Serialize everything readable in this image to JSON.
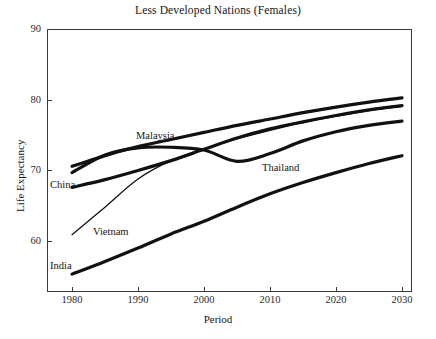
{
  "chart_data": {
    "type": "line",
    "title": "Less Developed Nations (Females)",
    "xlabel": "Period",
    "ylabel": "Life Expectancy",
    "xlim": [
      1977,
      2033
    ],
    "ylim": [
      55,
      90
    ],
    "xticks": [
      1980,
      1990,
      2000,
      2010,
      2020,
      2030
    ],
    "yticks": [
      60,
      70,
      80,
      90
    ],
    "grid": false,
    "legend": "inline-labels",
    "x": [
      1980,
      1985,
      1990,
      1995,
      2000,
      2005,
      2010,
      2015,
      2020,
      2025,
      2030
    ],
    "series": [
      {
        "name": "Malaysia",
        "label": "Malaysia",
        "values": [
          70.6,
          72.1,
          73.4,
          74.4,
          75.4,
          76.4,
          77.3,
          78.2,
          79.0,
          79.7,
          80.3
        ],
        "stroke": "thick"
      },
      {
        "name": "Thailand",
        "label": "Thailand",
        "values": [
          69.7,
          72.2,
          73.2,
          73.3,
          72.9,
          71.3,
          72.4,
          74.2,
          75.5,
          76.4,
          77.0
        ],
        "stroke": "thick"
      },
      {
        "name": "China",
        "label": "China",
        "values": [
          67.6,
          68.7,
          70.0,
          71.4,
          73.0,
          74.6,
          75.9,
          76.9,
          77.8,
          78.6,
          79.2
        ],
        "stroke": "thick"
      },
      {
        "name": "Vietnam",
        "label": "Vietnam",
        "values": [
          60.9,
          64.8,
          68.8,
          71.4,
          73.1,
          74.5,
          75.7,
          76.8,
          77.7,
          78.5,
          79.1
        ],
        "stroke": "thin"
      },
      {
        "name": "India",
        "label": "India",
        "values": [
          55.3,
          57.1,
          59.0,
          61.0,
          62.8,
          64.8,
          66.7,
          68.3,
          69.7,
          71.0,
          72.1
        ],
        "stroke": "thick"
      }
    ]
  },
  "labels": {
    "malaysia": "Malaysia",
    "thailand": "Thailand",
    "china": "China",
    "vietnam": "Vietnam",
    "india": "India"
  },
  "ytick_labels": [
    "90",
    "80",
    "70",
    "60"
  ],
  "xtick_labels": [
    "1980",
    "1990",
    "2000",
    "2010",
    "2020",
    "2030"
  ],
  "colors": {
    "line": "#111111",
    "axis": "#3a3a3a",
    "text": "#141414",
    "background": "#ffffff"
  }
}
